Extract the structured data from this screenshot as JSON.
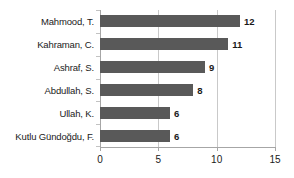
{
  "chart_data": {
    "type": "bar",
    "orientation": "horizontal",
    "title": "",
    "subtitle": "",
    "xlabel": "",
    "ylabel": "",
    "categories": [
      "Mahmood, T.",
      "Kahraman, C.",
      "Ashraf, S.",
      "Abdullah, S.",
      "Ullah, K.",
      "Kutlu Gündoğdu, F."
    ],
    "values": [
      12,
      11,
      9,
      8,
      6,
      6
    ],
    "data_labels": [
      "12",
      "11",
      "9",
      "8",
      "6",
      "6"
    ],
    "xlim": [
      0,
      15
    ],
    "xticks": [
      0,
      5,
      10,
      15
    ],
    "xtick_labels": [
      "0",
      "5",
      "10",
      "15"
    ],
    "grid": {
      "vertical": true,
      "horizontal": false,
      "color": "#c9c9c9"
    },
    "legend": {
      "visible": false,
      "position": "none",
      "entries": []
    },
    "colors": {
      "bar": "#595959",
      "axis": "#a6a6a6",
      "gridline": "#c9c9c9",
      "text": "#1a1a1a",
      "background": "#ffffff"
    }
  }
}
